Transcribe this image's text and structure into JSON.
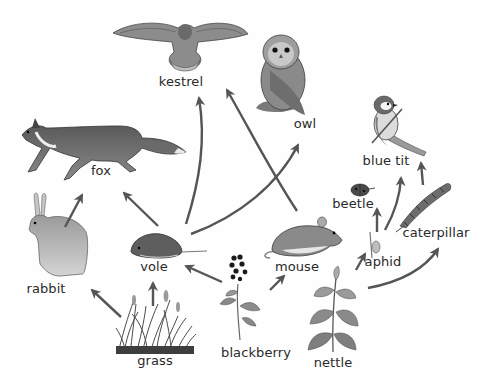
{
  "diagram": {
    "type": "food-web",
    "arrow_color": "#555555",
    "organisms": [
      {
        "id": "kestrel",
        "label": "kestrel",
        "role": "top predator"
      },
      {
        "id": "owl",
        "label": "owl",
        "role": "top predator"
      },
      {
        "id": "fox",
        "label": "fox",
        "role": "predator"
      },
      {
        "id": "blue_tit",
        "label": "blue tit",
        "role": "predator"
      },
      {
        "id": "beetle",
        "label": "beetle",
        "role": "consumer"
      },
      {
        "id": "caterpillar",
        "label": "caterpillar",
        "role": "herbivore"
      },
      {
        "id": "aphid",
        "label": "aphid",
        "role": "herbivore"
      },
      {
        "id": "vole",
        "label": "vole",
        "role": "herbivore"
      },
      {
        "id": "mouse",
        "label": "mouse",
        "role": "herbivore"
      },
      {
        "id": "rabbit",
        "label": "rabbit",
        "role": "herbivore"
      },
      {
        "id": "grass",
        "label": "grass",
        "role": "producer"
      },
      {
        "id": "blackberry",
        "label": "blackberry",
        "role": "producer"
      },
      {
        "id": "nettle",
        "label": "nettle",
        "role": "producer"
      }
    ],
    "edges": [
      {
        "from": "grass",
        "to": "rabbit"
      },
      {
        "from": "grass",
        "to": "vole"
      },
      {
        "from": "blackberry",
        "to": "vole"
      },
      {
        "from": "blackberry",
        "to": "mouse"
      },
      {
        "from": "nettle",
        "to": "aphid"
      },
      {
        "from": "nettle",
        "to": "caterpillar"
      },
      {
        "from": "rabbit",
        "to": "fox"
      },
      {
        "from": "vole",
        "to": "fox"
      },
      {
        "from": "vole",
        "to": "kestrel"
      },
      {
        "from": "vole",
        "to": "owl"
      },
      {
        "from": "mouse",
        "to": "kestrel"
      },
      {
        "from": "aphid",
        "to": "beetle"
      },
      {
        "from": "aphid",
        "to": "blue_tit"
      },
      {
        "from": "caterpillar",
        "to": "blue_tit"
      }
    ]
  }
}
